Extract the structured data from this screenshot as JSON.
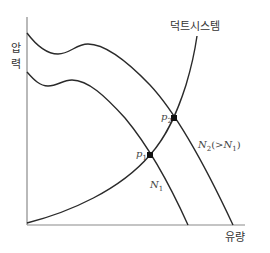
{
  "diagram": {
    "type": "fan-performance-curve",
    "y_axis_label_line1": "압",
    "y_axis_label_line2": "력",
    "x_axis_label": "유량",
    "system_curve_label": "덕트시스템",
    "curves": [
      {
        "id": "N1",
        "label_main": "N",
        "label_sub": "1",
        "label_suffix": ""
      },
      {
        "id": "N2",
        "label_main": "N",
        "label_sub": "2",
        "label_suffix_open": "(>",
        "label_suffix_main": "N",
        "label_suffix_sub": "1",
        "label_suffix_close": ")"
      }
    ],
    "points": [
      {
        "id": "p1",
        "label_main": "p",
        "label_sub": "1"
      },
      {
        "id": "p2",
        "label_main": "p",
        "label_sub": "2"
      }
    ],
    "colors": {
      "axis": "#888888",
      "curve": "#2a2a2a",
      "text": "#333333"
    }
  }
}
